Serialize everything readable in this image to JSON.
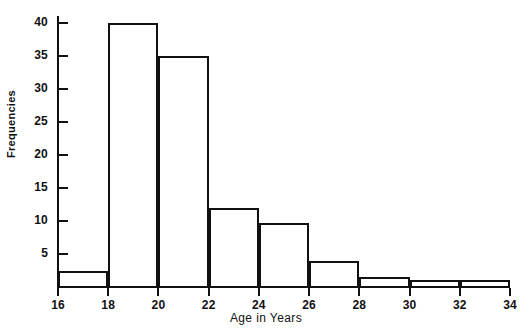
{
  "chart_data": {
    "type": "bar",
    "title": "",
    "xlabel": "Age in Years",
    "ylabel": "Frequencies",
    "categories": [
      "16-18",
      "18-20",
      "20-22",
      "22-24",
      "24-26",
      "26-28",
      "28-30",
      "30-32",
      "32-34"
    ],
    "bin_edges": [
      16,
      18,
      20,
      22,
      24,
      26,
      28,
      30,
      32,
      34
    ],
    "values": [
      2.5,
      40,
      35,
      12,
      9.7,
      4,
      1.5,
      1,
      1
    ],
    "xlim": [
      16,
      34
    ],
    "ylim": [
      0,
      42
    ],
    "x_ticks": [
      "16",
      "18",
      "20",
      "22",
      "24",
      "26",
      "28",
      "30",
      "32",
      "34"
    ],
    "y_ticks": [
      "5",
      "10",
      "15",
      "20",
      "25",
      "30",
      "35",
      "40"
    ],
    "grid": false,
    "legend": null
  },
  "axes": {
    "y_label": "Frequencies",
    "x_label": "Age in Years"
  },
  "header": {
    "title_fragment": ""
  }
}
